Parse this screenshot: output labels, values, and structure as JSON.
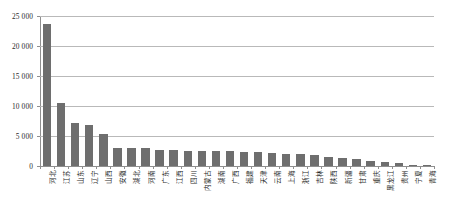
{
  "chart_data": {
    "type": "bar",
    "title": "",
    "xlabel": "",
    "ylabel": "",
    "ylim": [
      0,
      25000
    ],
    "yticks": [
      0,
      5000,
      10000,
      15000,
      20000,
      25000
    ],
    "ytick_labels": [
      "0",
      "5 000",
      "10 000",
      "15 000",
      "20 000",
      "25 000"
    ],
    "grid": true,
    "legend": false,
    "bar_color": "#6e6e6e",
    "grid_color": "#b9b9b9",
    "axis_color": "#8f8f8f",
    "categories": [
      "河北",
      "江苏",
      "山东",
      "辽宁",
      "山西",
      "安徽",
      "湖北",
      "河南",
      "广东",
      "江西",
      "四川",
      "内蒙古",
      "湖南",
      "广西",
      "福建",
      "天津",
      "云南",
      "上海",
      "浙江",
      "吉林",
      "陕西",
      "新疆",
      "甘肃",
      "重庆",
      "黑龙江",
      "贵州",
      "宁夏",
      "青海"
    ],
    "values": [
      23600,
      10500,
      7100,
      6900,
      5300,
      3050,
      3000,
      2950,
      2620,
      2600,
      2580,
      2550,
      2520,
      2450,
      2400,
      2300,
      2200,
      2000,
      1950,
      1900,
      1500,
      1300,
      1150,
      900,
      620,
      430,
      250,
      120
    ]
  }
}
